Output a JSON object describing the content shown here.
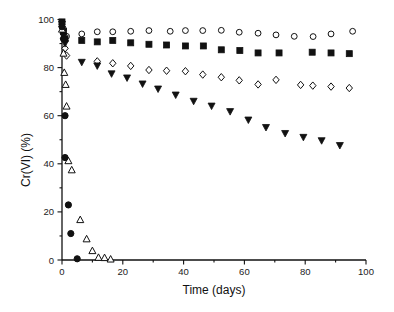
{
  "chart_data": {
    "type": "scatter",
    "title": "",
    "xlabel": "Time (days)",
    "ylabel": "Cr(VI) (%)",
    "xlim": [
      0,
      100
    ],
    "ylim": [
      0,
      100
    ],
    "x_ticks": [
      "0",
      "20",
      "40",
      "60",
      "80",
      "100"
    ],
    "y_ticks": [
      "0",
      "20",
      "40",
      "60",
      "80",
      "100"
    ],
    "grid": false,
    "legend": null,
    "series": [
      {
        "name": "open-circle",
        "marker": "circle",
        "filled": false,
        "x": [
          0,
          0.5,
          1.5,
          6.5,
          11.6,
          16.7,
          22.6,
          28.6,
          35.6,
          40.6,
          46.3,
          52.4,
          58.3,
          64.5,
          70.4,
          76.4,
          82.6,
          88.5,
          95.6
        ],
        "y": [
          98,
          96,
          93,
          94,
          94.9,
          94.9,
          95.1,
          95.4,
          95.1,
          95.4,
          95.4,
          95.5,
          94.7,
          94.3,
          93.6,
          93,
          92.9,
          94,
          95.1
        ]
      },
      {
        "name": "filled-square",
        "marker": "square",
        "filled": true,
        "x": [
          0,
          0.5,
          1,
          6.5,
          11.6,
          16.7,
          22.6,
          28.6,
          34.4,
          40.6,
          46.5,
          52.4,
          58.5,
          64.5,
          71.4,
          82.3,
          88.5,
          94.5
        ],
        "y": [
          99,
          95,
          92,
          91.3,
          90.7,
          91.3,
          90.3,
          89.7,
          89.4,
          89,
          89,
          87.4,
          87.1,
          86.1,
          86.1,
          86.4,
          86.1,
          85.8
        ]
      },
      {
        "name": "open-diamond",
        "marker": "diamond",
        "filled": false,
        "x": [
          0,
          0.5,
          1,
          1.5,
          11.6,
          16.7,
          22.6,
          28.6,
          34.4,
          40.6,
          46.3,
          52.4,
          58.3,
          64.5,
          70.4,
          78.5,
          82.5,
          88.5,
          94.5
        ],
        "y": [
          97,
          92,
          88,
          85,
          82.6,
          81.8,
          80.7,
          79,
          78.7,
          78.5,
          77.1,
          76,
          74.7,
          73,
          74.9,
          72.8,
          72.5,
          72.1,
          71.5
        ]
      },
      {
        "name": "filled-triangle-down",
        "marker": "triangle-down",
        "filled": true,
        "x": [
          0,
          0.5,
          1,
          6.5,
          11.6,
          16.3,
          21.4,
          26.5,
          31.6,
          37.4,
          43.3,
          49.2,
          55.3,
          61.3,
          67.1,
          73.4,
          79.4,
          85.4,
          91.4
        ],
        "y": [
          98,
          93,
          90,
          82.2,
          80.7,
          77.4,
          75.7,
          73.2,
          71.1,
          68.6,
          66,
          64,
          61.7,
          58.2,
          55.1,
          52.6,
          51,
          49.6,
          47.6
        ]
      },
      {
        "name": "open-triangle-up",
        "marker": "triangle-up",
        "filled": false,
        "x": [
          0,
          0.5,
          0.75,
          1.2,
          1.5,
          2.1,
          3.2,
          6,
          8.1,
          10,
          12,
          14,
          16
        ],
        "y": [
          96,
          86,
          78,
          73,
          64,
          41.3,
          37.5,
          16.8,
          8.8,
          3.9,
          1.1,
          1,
          0.4
        ]
      },
      {
        "name": "filled-circle",
        "marker": "circle",
        "filled": true,
        "x": [
          0,
          0.5,
          1,
          1,
          2.1,
          2.9,
          5
        ],
        "y": [
          97,
          92,
          60,
          42.6,
          22.9,
          11,
          0.5
        ]
      }
    ]
  }
}
